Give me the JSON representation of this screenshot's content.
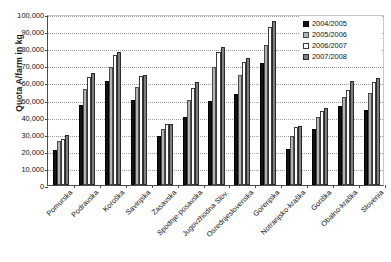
{
  "chart_data": {
    "type": "bar",
    "title": "",
    "xlabel": "",
    "ylabel": "Quota A/farm in kg",
    "ylim": [
      0,
      100000
    ],
    "ytick_step": 10000,
    "ytick_labels": [
      "100,000",
      "90,000",
      "80,000",
      "70,000",
      "60,000",
      "50,000",
      "40,000",
      "30,000",
      "20,000",
      "10,000",
      "0"
    ],
    "grid": true,
    "legend_position": "top-right",
    "categories": [
      "Pomurska",
      "Podravska",
      "Koroška",
      "Savinjska",
      "Zasavska",
      "Spodnje-posavska",
      "Jugovzhodna Slov.",
      "Osrednjeslovenska",
      "Gorenjska",
      "Notranjsko-kraška",
      "Goriška",
      "Obalno-kraška",
      "Slovenia"
    ],
    "series": [
      {
        "name": "2004/2005",
        "color": "#131313",
        "values": [
          20500,
          47000,
          61000,
          50000,
          28500,
          39500,
          49000,
          53500,
          71500,
          21000,
          32500,
          46500,
          44000
        ]
      },
      {
        "name": "2005/2006",
        "color": "#b4b4b4",
        "values": [
          25500,
          56000,
          69000,
          57500,
          32500,
          50000,
          69000,
          64500,
          82000,
          28500,
          39500,
          51500,
          54000
        ]
      },
      {
        "name": "2006/2007",
        "color": "#fcfcfc",
        "values": [
          27000,
          63000,
          76000,
          63500,
          35500,
          57000,
          78000,
          72000,
          92500,
          34000,
          43500,
          55500,
          60000
        ]
      },
      {
        "name": "2007/2008",
        "color": "#7e7e7e",
        "values": [
          29000,
          65500,
          77500,
          64500,
          35500,
          60000,
          81000,
          74500,
          96000,
          34500,
          45000,
          61000,
          62500
        ]
      }
    ]
  }
}
